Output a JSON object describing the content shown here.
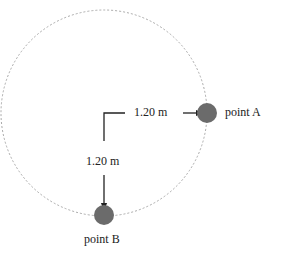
{
  "diagram": {
    "circle": {
      "cx": 104,
      "cy": 113,
      "r": 103,
      "stroke": "#aaaaaa",
      "style": "dotted"
    },
    "points": [
      {
        "id": "A",
        "label": "point A",
        "cx": 207,
        "cy": 113,
        "r": 10,
        "fill": "#6b6b6b"
      },
      {
        "id": "B",
        "label": "point B",
        "cx": 104,
        "cy": 215,
        "r": 10,
        "fill": "#6b6b6b"
      }
    ],
    "distances": [
      {
        "label": "1.20 m",
        "to": "A"
      },
      {
        "label": "1.20 m",
        "to": "B"
      }
    ]
  }
}
